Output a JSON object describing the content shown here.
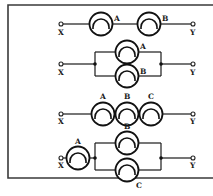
{
  "diagram": {
    "title": "",
    "terminal_labels": {
      "left": "X",
      "right": "Y"
    },
    "circuits": [
      {
        "id": "series-AB",
        "type": "series",
        "bulbs": [
          {
            "label": "A"
          },
          {
            "label": "B"
          }
        ]
      },
      {
        "id": "parallel-AB",
        "type": "parallel",
        "bulbs": [
          {
            "label": "A"
          },
          {
            "label": "B"
          }
        ]
      },
      {
        "id": "series-ABC",
        "type": "series",
        "bulbs": [
          {
            "label": "A"
          },
          {
            "label": "B"
          },
          {
            "label": "C"
          }
        ]
      },
      {
        "id": "A-series-with-parallel-BC",
        "type": "series-parallel",
        "bulbs": [
          {
            "label": "A"
          },
          {
            "label": "B"
          },
          {
            "label": "C"
          }
        ]
      }
    ],
    "colors": {
      "line": "#1a1a1a",
      "frame": "#3a3a3a",
      "background": "#ffffff"
    }
  }
}
